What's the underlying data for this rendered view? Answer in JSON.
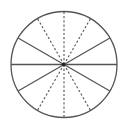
{
  "diagram": {
    "type": "circle-divided-into-sectors",
    "width": 123,
    "height": 129,
    "background": "#ffffff",
    "stroke_color": "#555555",
    "circle": {
      "cx": 64,
      "cy": 64.5,
      "r": 53,
      "stroke_width": 1.3
    },
    "sector_count": 12,
    "solid_radii_deg": [
      0,
      30,
      150,
      180,
      210,
      330
    ],
    "dashed_radii_deg": [
      60,
      90,
      120,
      240,
      270,
      300
    ],
    "solid_stroke_width": 1.3,
    "dashed_stroke_width": 1.1,
    "dash_pattern": "2.2 2",
    "center_dot_radius": 1.8
  }
}
